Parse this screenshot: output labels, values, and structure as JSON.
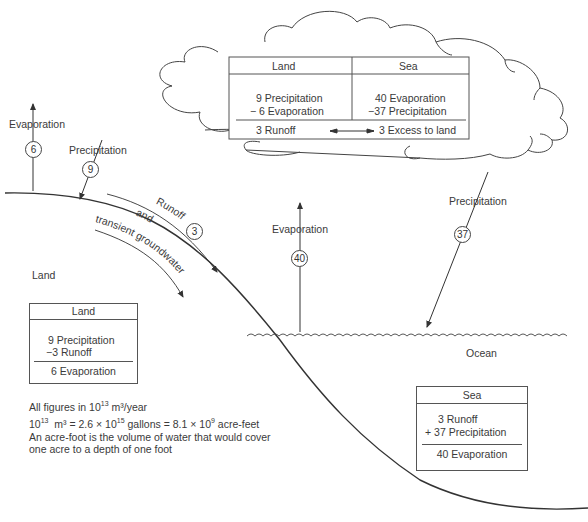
{
  "cloud_table": {
    "headers": [
      "Land",
      "Sea"
    ],
    "land_lines": [
      "9 Precipitation",
      "− 6 Evaporation"
    ],
    "sea_lines": [
      "40 Evaporation",
      "−37 Precipitation"
    ],
    "land_result": "3 Runoff",
    "sea_result": "3 Excess to land"
  },
  "flows": {
    "land_evaporation": {
      "label": "Evaporation",
      "value": "6"
    },
    "land_precipitation": {
      "label": "Precipitation",
      "value": "9"
    },
    "runoff": {
      "label": "Runoff",
      "value": "3"
    },
    "groundwater_line1": "and",
    "groundwater_line2": "transient groundwater",
    "sea_evaporation": {
      "label": "Evaporation",
      "value": "40"
    },
    "sea_precipitation": {
      "label": "Precipitation",
      "value": "37"
    }
  },
  "regions": {
    "land": "Land",
    "ocean": "Ocean"
  },
  "land_box": {
    "header": "Land",
    "lines": [
      "9 Precipitation",
      "−3 Runoff"
    ],
    "result": "6 Evaporation"
  },
  "sea_box": {
    "header": "Sea",
    "lines": [
      "3 Runoff",
      "+ 37 Precipitation"
    ],
    "result": "40 Evaporation"
  },
  "notes": {
    "line1_pre": "All figures in 10",
    "line1_sup": "13",
    "line1_post": " m³/year",
    "line2_a": "10",
    "line2_a_sup": "13",
    "line2_b": "  m³ = 2.6 × 10",
    "line2_b_sup": "15",
    "line2_c": " gallons = 8.1 × 10",
    "line2_c_sup": "9",
    "line2_d": " acre-feet",
    "line3": "An acre-foot is the volume of water that would cover",
    "line4": "one acre to a depth of one foot"
  }
}
